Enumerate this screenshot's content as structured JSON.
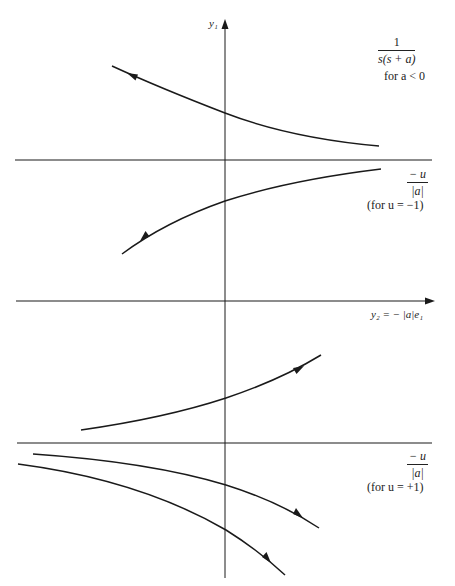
{
  "figure": {
    "axes": {
      "vertical": {
        "label": "y₁"
      },
      "horizontal": {
        "label": "y₂ = − |a|e₁"
      }
    },
    "top_panel": {
      "transfer_function": {
        "numerator": "1",
        "denominator": "s(s + a)"
      },
      "condition": "for a < 0"
    },
    "upper_region": {
      "fraction": {
        "numerator": "− u",
        "denominator": "|a|"
      },
      "condition": "(for u = −1)"
    },
    "lower_region": {
      "fraction": {
        "numerator": "− u",
        "denominator": "|a|"
      },
      "condition": "(for u = +1)"
    },
    "lines": {
      "asymptote_upper_y": 160,
      "y2_axis_y": 301,
      "asymptote_lower_y": 443,
      "y1_axis_x": 225
    },
    "trajectories": [
      {
        "id": "traj-1",
        "direction": "up-left",
        "points": [
          [
            112,
            66
          ],
          [
            225,
            113
          ],
          [
            379,
            146
          ]
        ]
      },
      {
        "id": "traj-2",
        "direction": "down-left",
        "points": [
          [
            381,
            169
          ],
          [
            225,
            201
          ],
          [
            122,
            254
          ]
        ]
      },
      {
        "id": "traj-3",
        "direction": "up-right",
        "points": [
          [
            81,
            430
          ],
          [
            226,
            398
          ],
          [
            321,
            355
          ]
        ]
      },
      {
        "id": "traj-4",
        "direction": "down-right",
        "points": [
          [
            33,
            454
          ],
          [
            226,
            485
          ],
          [
            319,
            528
          ]
        ]
      },
      {
        "id": "traj-5",
        "direction": "down-right",
        "points": [
          [
            18,
            464
          ],
          [
            226,
            530
          ],
          [
            285,
            575
          ]
        ]
      }
    ],
    "colors": {
      "ink": "#1a1a1a",
      "background": "#ffffff"
    }
  }
}
